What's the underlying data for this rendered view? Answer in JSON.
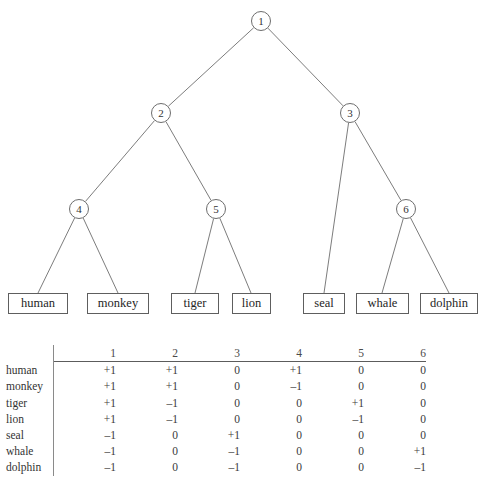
{
  "figure": {
    "kind": "hierarchical-classifier-tree-with-code-matrix"
  },
  "tree": {
    "nodes": [
      {
        "id": "n1",
        "label": "1",
        "x": 261,
        "y": 21
      },
      {
        "id": "n2",
        "label": "2",
        "x": 161,
        "y": 113
      },
      {
        "id": "n3",
        "label": "3",
        "x": 350,
        "y": 113
      },
      {
        "id": "n4",
        "label": "4",
        "x": 79,
        "y": 209
      },
      {
        "id": "n5",
        "label": "5",
        "x": 216,
        "y": 209
      },
      {
        "id": "n6",
        "label": "6",
        "x": 406,
        "y": 209
      }
    ],
    "leaves": [
      {
        "id": "human",
        "label": "human",
        "x": 8,
        "y": 293,
        "w": 60,
        "cx": 38,
        "parent": "n4"
      },
      {
        "id": "monkey",
        "label": "monkey",
        "x": 87,
        "y": 293,
        "w": 62,
        "cx": 118,
        "parent": "n4"
      },
      {
        "id": "tiger",
        "label": "tiger",
        "x": 171,
        "y": 293,
        "w": 48,
        "cx": 195,
        "parent": "n5"
      },
      {
        "id": "lion",
        "label": "lion",
        "x": 232,
        "y": 293,
        "w": 39,
        "cx": 251,
        "parent": "n5"
      },
      {
        "id": "seal",
        "label": "seal",
        "x": 303,
        "y": 293,
        "w": 42,
        "cx": 324,
        "parent": "n3"
      },
      {
        "id": "whale",
        "label": "whale",
        "x": 356,
        "y": 293,
        "w": 53,
        "cx": 382,
        "parent": "n6"
      },
      {
        "id": "dolphin",
        "label": "dolphin",
        "x": 420,
        "y": 293,
        "w": 58,
        "cx": 449,
        "parent": "n6"
      }
    ],
    "edges": [
      {
        "from": "n1",
        "to": "n2"
      },
      {
        "from": "n1",
        "to": "n3"
      },
      {
        "from": "n2",
        "to": "n4"
      },
      {
        "from": "n2",
        "to": "n5"
      },
      {
        "from": "n3",
        "to": "seal"
      },
      {
        "from": "n3",
        "to": "n6"
      },
      {
        "from": "n4",
        "to": "human"
      },
      {
        "from": "n4",
        "to": "monkey"
      },
      {
        "from": "n5",
        "to": "tiger"
      },
      {
        "from": "n5",
        "to": "lion"
      },
      {
        "from": "n6",
        "to": "whale"
      },
      {
        "from": "n6",
        "to": "dolphin"
      }
    ]
  },
  "matrix": {
    "corner_label": "",
    "columns": [
      "1",
      "2",
      "3",
      "4",
      "5",
      "6"
    ],
    "rows": [
      {
        "label": "human",
        "values": [
          "+1",
          "+1",
          "0",
          "+1",
          "0",
          "0"
        ]
      },
      {
        "label": "monkey",
        "values": [
          "+1",
          "+1",
          "0",
          "–1",
          "0",
          "0"
        ]
      },
      {
        "label": "tiger",
        "values": [
          "+1",
          "–1",
          "0",
          "0",
          "+1",
          "0"
        ]
      },
      {
        "label": "lion",
        "values": [
          "+1",
          "–1",
          "0",
          "0",
          "–1",
          "0"
        ]
      },
      {
        "label": "seal",
        "values": [
          "–1",
          "0",
          "+1",
          "0",
          "0",
          "0"
        ]
      },
      {
        "label": "whale",
        "values": [
          "–1",
          "0",
          "–1",
          "0",
          "0",
          "+1"
        ]
      },
      {
        "label": "dolphin",
        "values": [
          "–1",
          "0",
          "–1",
          "0",
          "0",
          "–1"
        ]
      }
    ]
  },
  "style": {
    "line_color": "#6d6d6d",
    "box_border": "#5e5e5e",
    "text_color": "#2b2b2b",
    "background": "#ffffff"
  }
}
